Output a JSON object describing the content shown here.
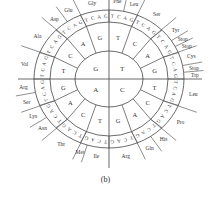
{
  "diagram": {
    "caption": "(b)",
    "colors": {
      "line": "#444444",
      "text": "#333333",
      "background": "#ffffff"
    },
    "geometry": {
      "center": [
        109,
        79
      ],
      "inner": [
        34,
        28
      ],
      "middle": [
        59,
        57
      ],
      "outer": [
        75,
        69
      ],
      "axis_h": [
        18,
        202
      ],
      "axis_v": [
        0,
        168
      ]
    },
    "center_bases": [
      "T",
      "C",
      "A",
      "G"
    ],
    "second_bases": [
      "T",
      "C",
      "A",
      "G"
    ],
    "third_bases": [
      "T",
      "C",
      "A",
      "G"
    ],
    "amino_acids": [
      {
        "name": "Phe",
        "start": 0,
        "end": 2
      },
      {
        "name": "Leu",
        "start": 2,
        "end": 4
      },
      {
        "name": "Ser",
        "start": 4,
        "end": 8
      },
      {
        "name": "Tyr",
        "start": 8,
        "end": 10
      },
      {
        "name": "Stop",
        "start": 10,
        "end": 11
      },
      {
        "name": "Stop",
        "start": 11,
        "end": 12
      },
      {
        "name": "Cys",
        "start": 12,
        "end": 14
      },
      {
        "name": "Stop",
        "start": 14,
        "end": 15
      },
      {
        "name": "Trp",
        "start": 15,
        "end": 16
      },
      {
        "name": "Leu",
        "start": 16,
        "end": 20
      },
      {
        "name": "Pro",
        "start": 20,
        "end": 24
      },
      {
        "name": "His",
        "start": 24,
        "end": 26
      },
      {
        "name": "Gln",
        "start": 26,
        "end": 28
      },
      {
        "name": "Arg",
        "start": 28,
        "end": 32
      },
      {
        "name": "Ile",
        "start": 32,
        "end": 35
      },
      {
        "name": "Met",
        "start": 35,
        "end": 36
      },
      {
        "name": "Thr",
        "start": 36,
        "end": 40
      },
      {
        "name": "Asn",
        "start": 40,
        "end": 42
      },
      {
        "name": "Lys",
        "start": 42,
        "end": 44
      },
      {
        "name": "Ser",
        "start": 44,
        "end": 46
      },
      {
        "name": "Arg",
        "start": 46,
        "end": 48
      },
      {
        "name": "Val",
        "start": 48,
        "end": 52
      },
      {
        "name": "Ala",
        "start": 52,
        "end": 56
      },
      {
        "name": "Asp",
        "start": 56,
        "end": 58
      },
      {
        "name": "Glu",
        "start": 58,
        "end": 60
      },
      {
        "name": "Gly",
        "start": 60,
        "end": 64
      }
    ]
  }
}
